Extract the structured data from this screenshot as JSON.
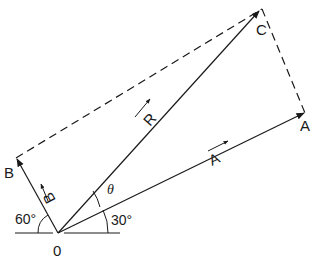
{
  "diagram": {
    "type": "vector-parallelogram",
    "points": {
      "origin": {
        "label": "0"
      },
      "A": {
        "label": "A"
      },
      "B": {
        "label": "B"
      },
      "C": {
        "label": "C"
      }
    },
    "vectors": {
      "A": {
        "label": "A",
        "angle_label": "30°"
      },
      "B": {
        "label": "B",
        "angle_label": "60°"
      },
      "R": {
        "label": "R"
      }
    },
    "angle_theta": "θ",
    "colors": {
      "stroke": "#1a1a1a",
      "background": "#ffffff"
    }
  }
}
